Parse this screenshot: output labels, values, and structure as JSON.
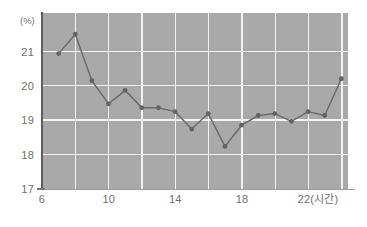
{
  "chart_data": {
    "type": "line",
    "title": "",
    "subtitle": "",
    "xlabel": "22(시간)",
    "ylabel": "(%)",
    "xlim": [
      6,
      24.4
    ],
    "ylim": [
      17,
      21.55
    ],
    "grid": true,
    "legend_position": "none",
    "x_unit_label": "(시간)",
    "y_unit_label": "(%)",
    "xticks": [
      6,
      10,
      14,
      18,
      22
    ],
    "xtick_labels": [
      "6",
      "10",
      "14",
      "18",
      "22(시간)"
    ],
    "x_gridlines": [
      8,
      10,
      12,
      14,
      16,
      18,
      20,
      22,
      24
    ],
    "yticks": [
      17,
      18,
      19,
      20,
      21
    ],
    "ytick_labels": [
      "17",
      "18",
      "19",
      "20",
      "21"
    ],
    "x": [
      7,
      8,
      9,
      10,
      11,
      12,
      13,
      14,
      15,
      16,
      17,
      18,
      19,
      20,
      21,
      22,
      23,
      24
    ],
    "values": [
      20.5,
      21.0,
      19.8,
      19.2,
      19.55,
      19.1,
      19.1,
      19.0,
      18.55,
      18.95,
      18.1,
      18.65,
      18.9,
      18.95,
      18.75,
      19.0,
      18.9,
      19.85
    ],
    "series": [
      {
        "name": "",
        "color": "#6b6b6b",
        "values": [
          20.5,
          21.0,
          19.8,
          19.2,
          19.55,
          19.1,
          19.1,
          19.0,
          18.55,
          18.95,
          18.1,
          18.65,
          18.9,
          18.95,
          18.75,
          19.0,
          18.9,
          19.85
        ]
      }
    ],
    "annotations": [],
    "colors": {
      "plot_background": "#a9a9a9",
      "gridline": "#f2f2f2",
      "series": "#6b6b6b",
      "axis": "#5f5f5f",
      "tick_text": "#6f6f6f",
      "page_background": "#ffffff"
    }
  }
}
